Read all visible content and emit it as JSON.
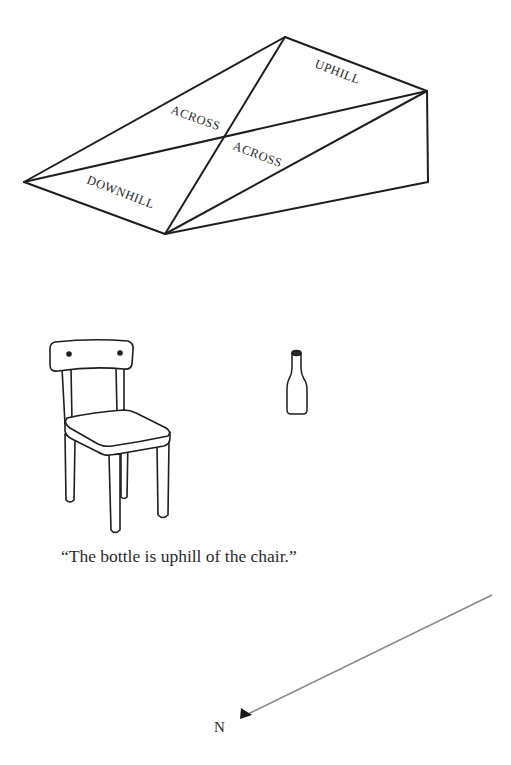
{
  "ramp": {
    "labels": {
      "uphill": "UPHILL",
      "across_upper": "ACROSS",
      "across_lower": "ACROSS",
      "downhill": "DOWNHILL"
    },
    "vertices": {
      "top": [
        285,
        37
      ],
      "right_top": [
        427,
        91
      ],
      "right_bottom": [
        428,
        182
      ],
      "left": [
        24,
        182
      ],
      "bottom": [
        165,
        234
      ],
      "center": [
        226,
        136
      ]
    }
  },
  "objects": {
    "chair": "chair",
    "bottle": "bottle"
  },
  "caption": "“The bottle is uphill of the chair.”",
  "compass": {
    "label": "N",
    "arrow_from": [
      492,
      595
    ],
    "arrow_to": [
      240,
      718
    ],
    "line_color": "#8a8a8a"
  }
}
